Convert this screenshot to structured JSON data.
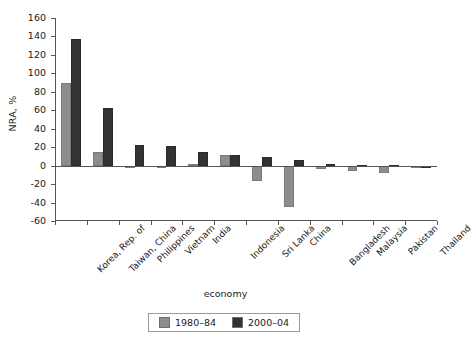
{
  "chart_data": {
    "type": "bar",
    "title": "",
    "xlabel": "economy",
    "ylabel": "NRA, %",
    "ylim": [
      -60,
      160
    ],
    "ytick_step": 20,
    "yticks": [
      160,
      140,
      120,
      100,
      80,
      60,
      40,
      20,
      0,
      -20,
      -40,
      -60
    ],
    "ytick_labels": [
      "160",
      "140",
      "120",
      "100",
      "80",
      "60",
      "40",
      "20",
      "0",
      "-20",
      "-40",
      "-60"
    ],
    "grid": false,
    "legend_position": "bottom",
    "categories": [
      "Korea, Rep. of",
      "Taiwan, China",
      "Philippines",
      "Vietnam",
      "India",
      "Indonesia",
      "Sri Lanka",
      "China",
      "Bangladesh",
      "Malaysia",
      "Pakistan",
      "Thailand"
    ],
    "series": [
      {
        "name": "1980–84",
        "color": "#8d8d8d",
        "values": [
          90,
          15,
          -2,
          0,
          2,
          11,
          -17,
          -45,
          -4,
          -6,
          -8,
          -2
        ]
      },
      {
        "name": "2000–04",
        "color": "#333333",
        "values": [
          137,
          62,
          22,
          21,
          15,
          12,
          9,
          6,
          2,
          1,
          1,
          0
        ]
      }
    ]
  },
  "legend": {
    "entries": [
      {
        "label": "1980–84",
        "color": "#8d8d8d"
      },
      {
        "label": "2000–04",
        "color": "#333333"
      }
    ]
  },
  "axes": {
    "y_title": "NRA, %",
    "x_title": "economy"
  }
}
